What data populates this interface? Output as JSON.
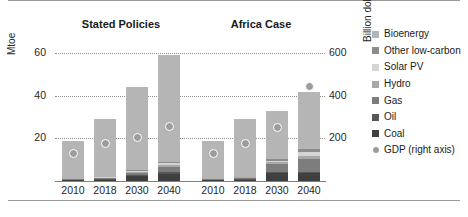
{
  "chart_data": {
    "type": "bar",
    "subtype": "grouped-stacked-bar-with-scatter-overlay",
    "title": "",
    "xlabel": "",
    "ylabel": "Mtoe",
    "y2label": "Billion dollars (2018)",
    "ylim": [
      0,
      68
    ],
    "y2lim": [
      0,
      680
    ],
    "yticks": [
      20,
      40,
      60
    ],
    "y2ticks": [
      200,
      400,
      600
    ],
    "grid": "horizontal-dotted",
    "legend_position": "right",
    "groups": [
      {
        "name": "Stated Policies",
        "categories": [
          "2010",
          "2018",
          "2030",
          "2040"
        ]
      },
      {
        "name": "Africa Case",
        "categories": [
          "2010",
          "2018",
          "2030",
          "2040"
        ]
      }
    ],
    "series": [
      {
        "name": "Coal",
        "color": "#3f3f3f",
        "values": {
          "Stated Policies": [
            0.3,
            0.5,
            2.2,
            3.4
          ],
          "Africa Case": [
            0.3,
            0.5,
            3.6,
            3.8
          ]
        }
      },
      {
        "name": "Oil",
        "color": "#575757",
        "values": {
          "Stated Policies": [
            0.2,
            0.3,
            0.5,
            0.7
          ],
          "Africa Case": [
            0.2,
            0.3,
            0.5,
            0.6
          ]
        }
      },
      {
        "name": "Gas",
        "color": "#7d7d7d",
        "values": {
          "Stated Policies": [
            0.3,
            0.5,
            1.0,
            2.4
          ],
          "Africa Case": [
            0.3,
            0.6,
            4.0,
            6.0
          ]
        }
      },
      {
        "name": "Hydro",
        "color": "#a8a8a8",
        "values": {
          "Stated Policies": [
            0.2,
            0.3,
            0.5,
            0.8
          ],
          "Africa Case": [
            0.2,
            0.3,
            0.7,
            1.4
          ]
        }
      },
      {
        "name": "Solar PV",
        "color": "#d4d4d4",
        "values": {
          "Stated Policies": [
            0.1,
            0.2,
            0.5,
            1.0
          ],
          "Africa Case": [
            0.1,
            0.2,
            0.8,
            2.0
          ]
        }
      },
      {
        "name": "Other low-carbon",
        "color": "#8c8c8c",
        "values": {
          "Stated Policies": [
            0.1,
            0.2,
            0.3,
            0.7
          ],
          "Africa Case": [
            0.1,
            0.2,
            0.6,
            1.2
          ]
        }
      },
      {
        "name": "Bioenergy",
        "color": "#b5b5b5",
        "values": {
          "Stated Policies": [
            17.8,
            27.0,
            39.0,
            50.0
          ],
          "Africa Case": [
            17.8,
            26.9,
            22.8,
            27.0
          ]
        }
      }
    ],
    "stack_order_bottom_to_top": [
      "Coal",
      "Oil",
      "Gas",
      "Hydro",
      "Solar PV",
      "Other low-carbon",
      "Bioenergy"
    ],
    "totals": {
      "Stated Policies": [
        19,
        29,
        44,
        59
      ],
      "Africa Case": [
        19,
        29,
        33,
        42
      ]
    },
    "overlay": {
      "name": "GDP (right axis)",
      "color": "#9c9c9c",
      "marker": "circle",
      "axis": "right",
      "values": {
        "Stated Policies": [
          130,
          175,
          205,
          255
        ],
        "Africa Case": [
          130,
          175,
          250,
          445
        ]
      }
    },
    "legend_entries": [
      {
        "label": "Bioenergy",
        "color": "#b5b5b5",
        "marker": "square"
      },
      {
        "label": "Other low-carbon",
        "color": "#8c8c8c",
        "marker": "square"
      },
      {
        "label": "Solar PV",
        "color": "#d4d4d4",
        "marker": "square"
      },
      {
        "label": "Hydro",
        "color": "#a8a8a8",
        "marker": "square"
      },
      {
        "label": "Gas",
        "color": "#7d7d7d",
        "marker": "square"
      },
      {
        "label": "Oil",
        "color": "#575757",
        "marker": "square"
      },
      {
        "label": "Coal",
        "color": "#3f3f3f",
        "marker": "square"
      },
      {
        "label": "GDP (right axis)",
        "color": "#9c9c9c",
        "marker": "circle"
      }
    ]
  }
}
